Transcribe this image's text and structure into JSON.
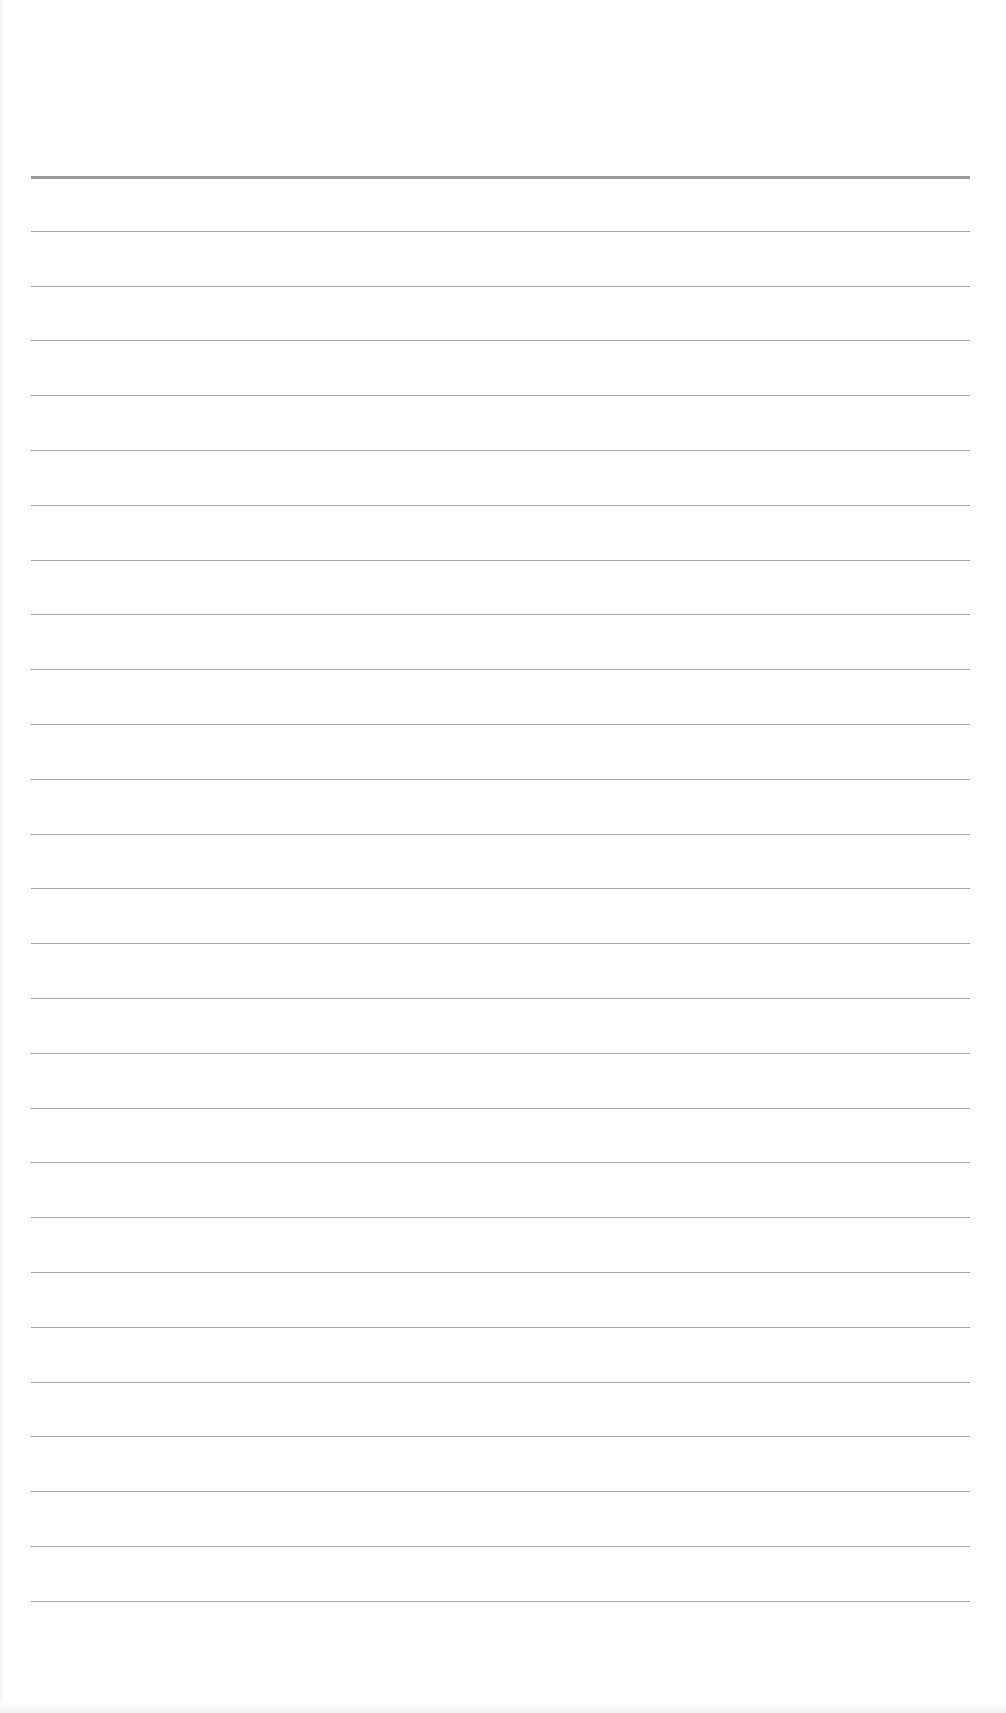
{
  "page": {
    "type": "blank-ruled-paper",
    "background_color": "#ffffff",
    "line_color": "#a8a8a8",
    "header_line_color": "#9a9a9a",
    "margin_left_px": 31,
    "margin_right_px": 970,
    "first_line_y": 176,
    "line_spacing_px": 54.8,
    "line_count": 27,
    "text": ""
  }
}
